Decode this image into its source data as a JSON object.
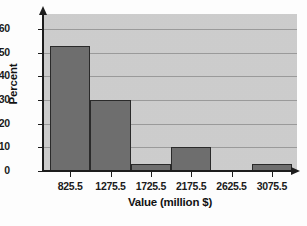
{
  "chart_data": {
    "type": "bar",
    "title": "",
    "xlabel": "Value (million $)",
    "ylabel": "Percent",
    "categories": [
      "825.5",
      "1275.5",
      "1725.5",
      "2175.5",
      "2625.5",
      "3075.5"
    ],
    "values": [
      53,
      30,
      3,
      10,
      0,
      3
    ],
    "ylim": [
      0,
      60
    ],
    "yticks": [
      0,
      10,
      20,
      30,
      40,
      50,
      60
    ],
    "ytick_labels": [
      "0",
      "10",
      "20",
      "30",
      "40",
      "50",
      "60"
    ],
    "grid": true,
    "legend": "none",
    "bar_color": "#6e6e6e",
    "plot_background": "#cfcfcf",
    "axis_color": "#1d1d1d",
    "gridline_color": "#9a9a9a"
  },
  "figure": {
    "caption_fragments": {
      "line1": "",
      "line2": "",
      "line3": ""
    }
  }
}
